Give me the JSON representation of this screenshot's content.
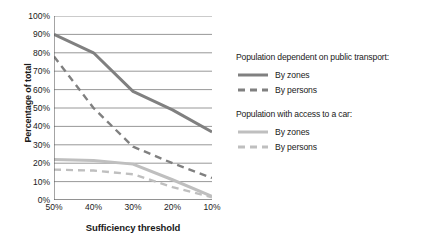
{
  "chart_data": {
    "type": "line",
    "title": "",
    "xlabel": "Sufficiency threshold",
    "ylabel": "Percentage of total",
    "categories": [
      "50%",
      "40%",
      "30%",
      "20%",
      "10%"
    ],
    "x_tick_labels": [
      "50%",
      "40%",
      "30%",
      "20%",
      "10%"
    ],
    "y_tick_labels": [
      "0%",
      "10%",
      "20%",
      "30%",
      "40%",
      "50%",
      "60%",
      "70%",
      "80%",
      "90%",
      "100%"
    ],
    "y_tick_values": [
      0,
      10,
      20,
      30,
      40,
      50,
      60,
      70,
      80,
      90,
      100
    ],
    "ylim": [
      0,
      100
    ],
    "x_axis_direction": "descending",
    "grid": "horizontal",
    "legend_position": "right",
    "series": [
      {
        "name": "By zones",
        "group": "Population dependent on public transport:",
        "style": "solid",
        "color": "#808080",
        "width": 3,
        "values": [
          90,
          80,
          59,
          49,
          37
        ]
      },
      {
        "name": "By persons",
        "group": "Population dependent on public transport:",
        "style": "dashed",
        "color": "#808080",
        "width": 2.4,
        "values": [
          78,
          50,
          29,
          20,
          12
        ]
      },
      {
        "name": "By zones",
        "group": "Population with access to a car:",
        "style": "solid",
        "color": "#bfbfbf",
        "width": 3,
        "values": [
          22,
          21.5,
          19.5,
          11,
          2
        ]
      },
      {
        "name": "By persons",
        "group": "Population with access to a car:",
        "style": "dashed",
        "color": "#bfbfbf",
        "width": 2.4,
        "values": [
          16.5,
          16,
          14,
          7,
          1.5
        ]
      }
    ]
  },
  "legend": {
    "groups": [
      {
        "title": "Population dependent on public transport:",
        "entries": [
          {
            "label": "By zones",
            "style": "solid",
            "color": "#808080"
          },
          {
            "label": "By persons",
            "style": "dashed",
            "color": "#808080"
          }
        ]
      },
      {
        "title": "Population with access to a car:",
        "entries": [
          {
            "label": "By zones",
            "style": "solid",
            "color": "#bfbfbf"
          },
          {
            "label": "By persons",
            "style": "dashed",
            "color": "#bfbfbf"
          }
        ]
      }
    ]
  },
  "colors": {
    "axis": "#595959",
    "grid": "#8c8c8c",
    "dark_series": "#808080",
    "light_series": "#bfbfbf",
    "text": "#1a1a1a",
    "background": "#ffffff"
  }
}
